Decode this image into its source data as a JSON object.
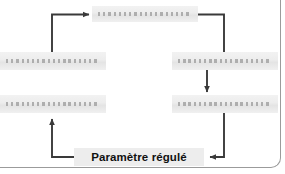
{
  "figure": {
    "type": "flowchart",
    "title": "",
    "style": {
      "node_fill": "#ececec",
      "connector_color": "#3a3a3a",
      "frame_border_color": "#9b9b9b",
      "label_color": "#111111",
      "background": "#ffffff"
    }
  },
  "nodes": [
    {
      "id": "node-top",
      "label": "",
      "readable": false,
      "position": "top-center"
    },
    {
      "id": "node-mid-left",
      "label": "",
      "readable": false,
      "position": "middle-left"
    },
    {
      "id": "node-mid-right",
      "label": "",
      "readable": false,
      "position": "middle-right"
    },
    {
      "id": "node-low-left",
      "label": "",
      "readable": false,
      "position": "lower-left"
    },
    {
      "id": "node-low-right",
      "label": "",
      "readable": false,
      "position": "lower-right"
    },
    {
      "id": "node-output",
      "label": "Paramètre régulé",
      "readable": true,
      "position": "bottom-center"
    }
  ],
  "connectors": [
    {
      "id": "edge-lowleft-to-top",
      "from": "node-low-left",
      "to": "node-top",
      "arrowhead": "right"
    },
    {
      "id": "edge-top-to-midright",
      "from": "node-top",
      "to": "node-mid-right",
      "arrowhead": "none"
    },
    {
      "id": "edge-midright-to-lowright",
      "from": "node-mid-right",
      "to": "node-low-right",
      "arrowhead": "down"
    },
    {
      "id": "edge-lowright-to-output",
      "from": "node-low-right",
      "to": "node-output",
      "arrowhead": "left"
    },
    {
      "id": "edge-output-to-lowleft",
      "from": "node-output",
      "to": "node-low-left",
      "arrowhead": "up"
    }
  ]
}
